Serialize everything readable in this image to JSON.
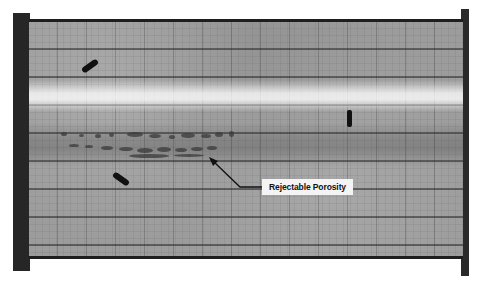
{
  "image": {
    "subject": "weld radiograph film",
    "annotation": {
      "label": "Rejectable Porosity",
      "arrow_target": "porosity cluster in weld band"
    },
    "features": {
      "markers": [
        "marker-upper-left",
        "marker-lower-left",
        "marker-right-vertical"
      ],
      "bright_band": "base metal edge highlight",
      "weld_band": "porosity indications"
    },
    "colors": {
      "film": "#9c9c9c",
      "frame": "#262626",
      "label_bg": "#f4f4f4",
      "label_text": "#111111"
    }
  }
}
